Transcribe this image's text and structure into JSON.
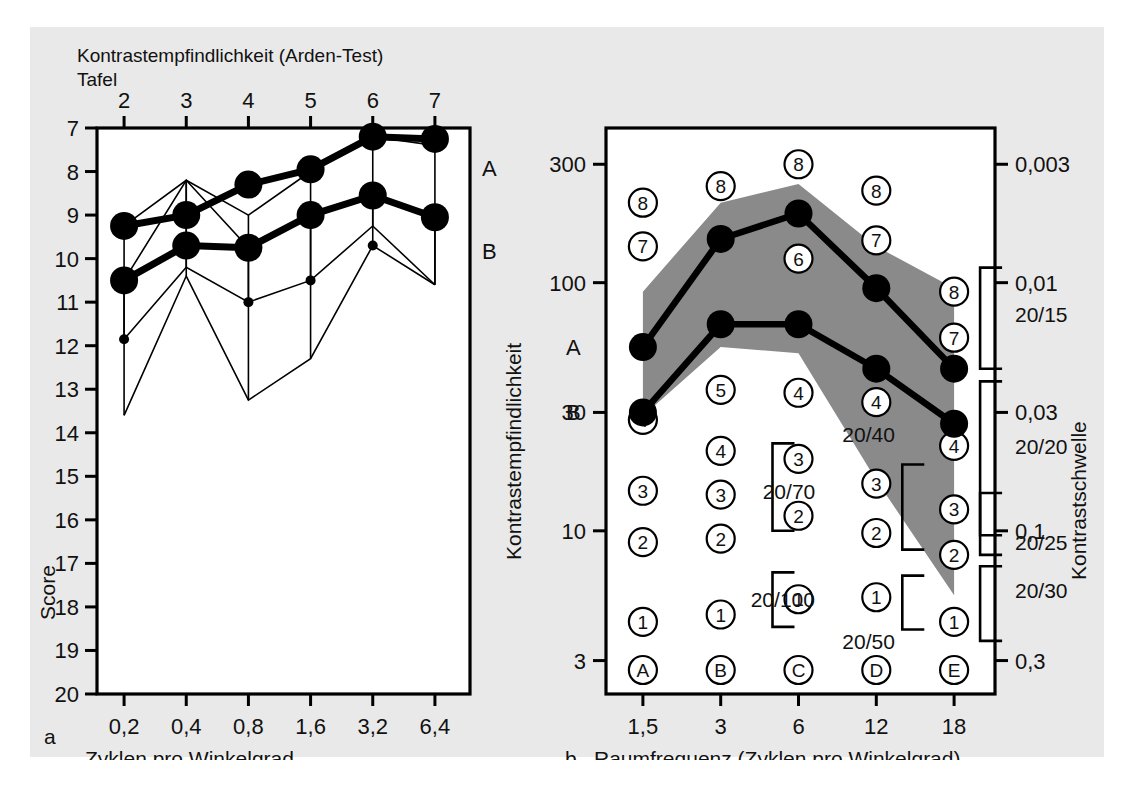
{
  "figure": {
    "background": "#e9e9e9",
    "plot_background": "#ffffff",
    "band_color": "#8a8a8a",
    "ink": "#000000",
    "panel_a_label": "a",
    "panel_b_label": "b",
    "bottom_caption": ""
  },
  "panel_a": {
    "top_title_line1": "Kontrastempfindlichkeit (Arden-Test)",
    "top_title_line2": "Tafel",
    "y_axis_label": "Score",
    "x_axis_label": "Zyklen pro Winkelgrad",
    "series_label_a": "A",
    "series_label_b": "B"
  },
  "panel_b": {
    "y_axis_label_left": "Kontrastempfindlichkeit",
    "y_axis_label_right": "Kontrastschwelle",
    "x_axis_label": "Raumfrequenz (Zyklen pro Winkelgrad)",
    "series_label_a": "A",
    "series_label_b": "B",
    "acuity_labels": [
      "20/15",
      "20/20",
      "20/25",
      "20/30",
      "20/40",
      "20/50",
      "20/70",
      "20/100"
    ],
    "column_letters": [
      "A",
      "B",
      "C",
      "D",
      "E"
    ]
  },
  "chart_data": [
    {
      "type": "line",
      "id": "panel_a",
      "title": "Kontrastempfindlichkeit (Arden-Test)",
      "subtitle": "Tafel",
      "xlabel": "Zyklen pro Winkelgrad",
      "ylabel": "Score",
      "x_top_label": "Tafel",
      "x_top_ticks": [
        "2",
        "3",
        "4",
        "5",
        "6",
        "7"
      ],
      "x_top_values": [
        2,
        3,
        4,
        5,
        6,
        7
      ],
      "categories": [
        "0,2",
        "0,4",
        "0,8",
        "1,6",
        "3,2",
        "6,4"
      ],
      "x_values": [
        0.2,
        0.4,
        0.8,
        1.6,
        3.2,
        6.4
      ],
      "ylim": [
        7,
        20
      ],
      "y_inverted": true,
      "y_ticks": [
        7,
        8,
        9,
        10,
        11,
        12,
        13,
        14,
        15,
        16,
        17,
        18,
        19,
        20
      ],
      "y_tick_labels": [
        "7",
        "8",
        "9",
        "10",
        "11",
        "12",
        "13",
        "14",
        "15",
        "16",
        "17",
        "18",
        "19",
        "20"
      ],
      "grid": false,
      "legend": "inline-right",
      "series": [
        {
          "name": "A",
          "values": [
            9.25,
            9.0,
            8.3,
            7.95,
            7.2,
            7.25
          ],
          "err_high": [
            9.25,
            8.2,
            9.0,
            8.0,
            7.2,
            7.4
          ],
          "err_low": [
            11.85,
            10.2,
            11.0,
            10.5,
            9.25,
            10.6
          ]
        },
        {
          "name": "B",
          "values": [
            10.5,
            9.7,
            9.75,
            9.0,
            8.55,
            9.05
          ],
          "err_high": [
            10.5,
            8.2,
            9.75,
            9.0,
            8.55,
            9.05
          ],
          "err_low": [
            13.6,
            10.4,
            13.25,
            12.3,
            9.7,
            10.6
          ]
        }
      ]
    },
    {
      "type": "line",
      "id": "panel_b",
      "xlabel": "Raumfrequenz (Zyklen pro Winkelgrad)",
      "ylabel": "Kontrastempfindlichkeit",
      "ylabel_right": "Kontrastschwelle",
      "categories": [
        "1,5",
        "3",
        "6",
        "12",
        "18"
      ],
      "x_values": [
        1.5,
        3,
        6,
        12,
        18
      ],
      "y_scale": "log",
      "ylim": [
        2.2,
        420
      ],
      "y_ticks": [
        300,
        100,
        30,
        10,
        3
      ],
      "y_tick_labels": [
        "300",
        "100",
        "30",
        "10",
        "3"
      ],
      "y_ticks_right": [
        0.003,
        0.01,
        0.03,
        0.1,
        0.3
      ],
      "y_tick_labels_right": [
        "0,003",
        "0,01",
        "0,03",
        "0,1",
        "0,3"
      ],
      "grid": false,
      "series": [
        {
          "name": "A",
          "values": [
            55,
            150,
            190,
            95,
            45
          ]
        },
        {
          "name": "B",
          "values": [
            30,
            68,
            68,
            45,
            27
          ]
        }
      ],
      "band": {
        "upper": [
          92,
          210,
          250,
          140,
          95
        ],
        "lower": [
          29,
          55,
          52,
          16,
          5.5
        ],
        "color": "#8a8a8a"
      },
      "score_markers": {
        "description": "Circled Arden score numbers per column",
        "columns": [
          {
            "x": "1,5",
            "letter": "A",
            "circles": [
              {
                "n": "8",
                "y": 210
              },
              {
                "n": "7",
                "y": 140
              },
              {
                "n": "4",
                "y": 28
              },
              {
                "n": "3",
                "y": 14.5
              },
              {
                "n": "2",
                "y": 9.0
              },
              {
                "n": "1",
                "y": 4.3
              }
            ]
          },
          {
            "x": "3",
            "letter": "B",
            "circles": [
              {
                "n": "8",
                "y": 245
              },
              {
                "n": "5",
                "y": 37
              },
              {
                "n": "4",
                "y": 21
              },
              {
                "n": "3",
                "y": 14.0
              },
              {
                "n": "2",
                "y": 9.3
              },
              {
                "n": "1",
                "y": 4.6
              }
            ]
          },
          {
            "x": "6",
            "letter": "C",
            "circles": [
              {
                "n": "8",
                "y": 300
              },
              {
                "n": "6",
                "y": 125
              },
              {
                "n": "4",
                "y": 36
              },
              {
                "n": "3",
                "y": 19.5
              },
              {
                "n": "2",
                "y": 11.5
              },
              {
                "n": "1",
                "y": 5.3
              }
            ]
          },
          {
            "x": "12",
            "letter": "D",
            "circles": [
              {
                "n": "8",
                "y": 235
              },
              {
                "n": "7",
                "y": 148
              },
              {
                "n": "4",
                "y": 33
              },
              {
                "n": "3",
                "y": 15.5
              },
              {
                "n": "2",
                "y": 9.8
              },
              {
                "n": "1",
                "y": 5.4
              }
            ]
          },
          {
            "x": "18",
            "letter": "E",
            "circles": [
              {
                "n": "8",
                "y": 92
              },
              {
                "n": "7",
                "y": 60
              },
              {
                "n": "4",
                "y": 22
              },
              {
                "n": "3",
                "y": 12.2
              },
              {
                "n": "2",
                "y": 8.0
              },
              {
                "n": "1",
                "y": 4.3
              }
            ]
          }
        ]
      },
      "acuity_annotations": [
        {
          "label": "20/70",
          "near_x": "3",
          "y": 14.5
        },
        {
          "label": "20/100",
          "near_x": "3",
          "y": 5.3
        },
        {
          "label": "20/40",
          "near_x": "12",
          "y": 22
        },
        {
          "label": "20/50",
          "near_x": "12",
          "y": 4.0
        },
        {
          "label": "20/15",
          "near_x": "right-axis",
          "y": 75
        },
        {
          "label": "20/20",
          "near_x": "right-axis",
          "y": 22
        },
        {
          "label": "20/25",
          "near_x": "right-axis",
          "y": 9.0
        },
        {
          "label": "20/30",
          "near_x": "right-axis",
          "y": 5.8
        }
      ]
    }
  ]
}
